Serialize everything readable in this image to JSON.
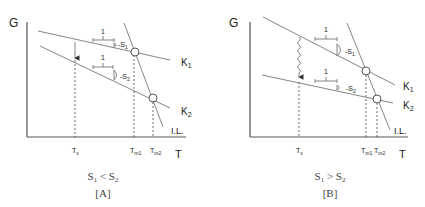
{
  "panels": [
    {
      "id": "A",
      "axis_y_label": "G",
      "axis_x_label": "T",
      "line_labels": {
        "k1": "K",
        "k1_sub": "1",
        "k2": "K",
        "k2_sub": "2",
        "il": "I.L."
      },
      "slope_labels": {
        "one_top": "1",
        "one_bottom": "1",
        "s1": "-S",
        "s1_sub": "1",
        "s2": "-S",
        "s2_sub": "2"
      },
      "tick_labels": {
        "tx": "T",
        "tx_sub": "x",
        "tm1": "T",
        "tm1_sub": "m1",
        "tm2": "T",
        "tm2_sub": "m2"
      },
      "condition": {
        "a": "S",
        "a_sub": "1",
        "op": " < ",
        "b": "S",
        "b_sub": "2"
      },
      "caption": "[A]"
    },
    {
      "id": "B",
      "axis_y_label": "G",
      "axis_x_label": "T",
      "line_labels": {
        "k1": "K",
        "k1_sub": "1",
        "k2": "K",
        "k2_sub": "2",
        "il": "I.L."
      },
      "slope_labels": {
        "one_top": "1",
        "one_bottom": "1",
        "s1": "-S",
        "s1_sub": "1",
        "s2": "-S",
        "s2_sub": "2"
      },
      "tick_labels": {
        "tx": "T",
        "tx_sub": "x",
        "tm1": "T",
        "tm1_sub": "m1",
        "tm2": "T",
        "tm2_sub": "m2"
      },
      "condition": {
        "a": "S",
        "a_sub": "1",
        "op": " > ",
        "b": "S",
        "b_sub": "2"
      },
      "caption": "[B]"
    }
  ]
}
